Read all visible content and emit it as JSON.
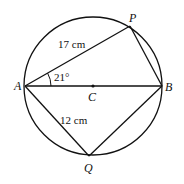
{
  "diagram": {
    "points": {
      "A": {
        "label": "A",
        "x": 25,
        "y": 86
      },
      "B": {
        "label": "B",
        "x": 162,
        "y": 86
      },
      "C": {
        "label": "C",
        "x": 93,
        "y": 86
      },
      "P": {
        "label": "P",
        "x": 130,
        "y": 26
      },
      "Q": {
        "label": "Q",
        "x": 89,
        "y": 156
      }
    },
    "circle": {
      "cx": 93,
      "cy": 86,
      "r": 69
    },
    "labels": {
      "AP_length": "17 cm",
      "AQ_length": "12 cm",
      "angle_PAB": "21°"
    },
    "colors": {
      "stroke": "#111111",
      "background": "#ffffff"
    }
  }
}
